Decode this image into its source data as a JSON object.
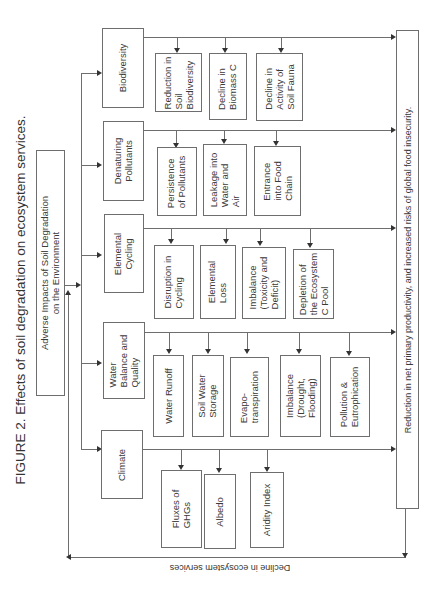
{
  "title": "FIGURE 2. Effects of soil degradation on ecosystem services.",
  "root": {
    "line1": "Adverse Impacts of Soil Degradation",
    "line2": "on the Environment"
  },
  "categories": [
    {
      "label": [
        "Biodiversity"
      ],
      "effects": [
        [
          "Reduction in",
          "Soil",
          "Biodiversity"
        ],
        [
          "Decline in",
          "Biomass C"
        ],
        [
          "Decline in",
          "Activity of",
          "Soil Fauna"
        ]
      ]
    },
    {
      "label": [
        "Denaturing",
        "Pollutants"
      ],
      "effects": [
        [
          "Persistence",
          "of Pollutants"
        ],
        [
          "Leakage into",
          "Water and",
          "Air"
        ],
        [
          "Entrance",
          "into Food",
          "Chain"
        ]
      ]
    },
    {
      "label": [
        "Elemental",
        "Cycling"
      ],
      "effects": [
        [
          "Disruption in",
          "Cycling"
        ],
        [
          "Elemental",
          "Loss"
        ],
        [
          "Imbalance",
          "(Toxicity and",
          "Deficit)"
        ],
        [
          "Depletion of",
          "the Ecosystem",
          "C Pool"
        ]
      ]
    },
    {
      "label": [
        "Water",
        "Balance and",
        "Quality"
      ],
      "effects": [
        [
          "Water Runoff"
        ],
        [
          "Soil Water",
          "Storage"
        ],
        [
          "Evapo-",
          "transpiration"
        ],
        [
          "Imbalance",
          "(Drought,",
          "Flooding)"
        ],
        [
          "Pollution &",
          "Eutrophication"
        ]
      ]
    },
    {
      "label": [
        "Climate"
      ],
      "effects": [
        [
          "Fluxes of",
          "GHGs"
        ],
        [
          "Albedo"
        ],
        [
          "Aridity Index"
        ]
      ]
    }
  ],
  "outcome": "Reduction in net primary productivity, and increased risks of global food insecurity.",
  "feedback": "Decline in ecosystem services"
}
